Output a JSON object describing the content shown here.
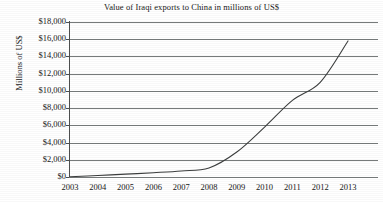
{
  "chart_data": {
    "type": "line",
    "title": "Value of Iraqi exports to China in millions of US$",
    "xlabel": "",
    "ylabel": "Millions of US$",
    "categories": [
      "2003",
      "2004",
      "2005",
      "2006",
      "2007",
      "2008",
      "2009",
      "2010",
      "2011",
      "2012",
      "2013"
    ],
    "values": [
      30,
      180,
      330,
      500,
      700,
      1050,
      2900,
      5800,
      8900,
      11000,
      15800
    ],
    "series": [
      {
        "name": "Value of Iraqi exports to China",
        "values": [
          30,
          180,
          330,
          500,
          700,
          1050,
          2900,
          5800,
          8900,
          11000,
          15800
        ]
      }
    ],
    "ylim": [
      0,
      18000
    ],
    "ytick_values": [
      0,
      2000,
      4000,
      6000,
      8000,
      10000,
      12000,
      14000,
      16000,
      18000
    ],
    "ytick_labels": [
      "$0",
      "$2,000",
      "$4,000",
      "$6,000",
      "$8,000",
      "$10,000",
      "$12,000",
      "$14,000",
      "$16,000",
      "$18,000"
    ],
    "grid": "horizontal",
    "legend": "none",
    "line_color": "#3c3e3e",
    "gridline_color": "#777b7b",
    "axis_color": "#4d4f4f",
    "background_color": "#ffffff"
  }
}
